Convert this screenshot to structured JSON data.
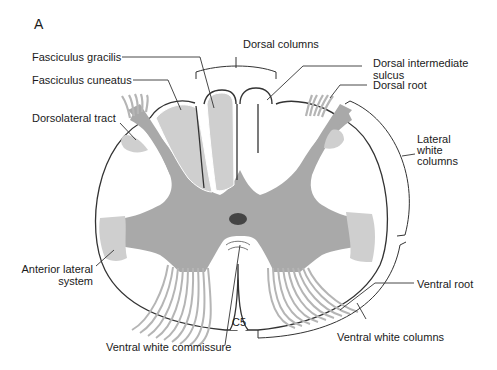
{
  "figure": {
    "panel_letter": "A",
    "segment_label": "C5",
    "colors": {
      "grey_matter": "#a9a9a9",
      "white_tract": "#cfcfcf",
      "outline": "#333333",
      "central_canal": "#444444",
      "background": "#ffffff"
    }
  },
  "labels": {
    "fasciculus_gracilis": "Fasciculus gracilis",
    "fasciculus_cuneatus": "Fasciculus cuneatus",
    "dorsolateral_tract": "Dorsolateral tract",
    "dorsal_columns": "Dorsal columns",
    "dorsal_intermediate_sulcus_1": "Dorsal intermediate",
    "dorsal_intermediate_sulcus_2": "sulcus",
    "dorsal_root": "Dorsal root",
    "lateral_white_columns_1": "Lateral",
    "lateral_white_columns_2": "white",
    "lateral_white_columns_3": "columns",
    "anterior_lateral_system_1": "Anterior lateral",
    "anterior_lateral_system_2": "system",
    "ventral_root": "Ventral root",
    "ventral_white_columns": "Ventral white columns",
    "ventral_white_commissure": "Ventral white commissure"
  }
}
